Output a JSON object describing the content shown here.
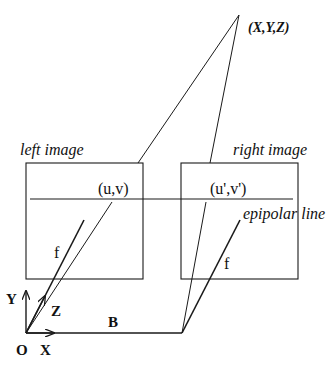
{
  "diagram": {
    "type": "stereo-camera-epipolar-geometry",
    "stroke_color": "#1a1a1a",
    "background": "#ffffff",
    "labels": {
      "world_point": "(X,Y,Z)",
      "left_image": "left image",
      "right_image": "right image",
      "left_projection": "(u,v)",
      "right_projection": "(u',v')",
      "epipolar_line": "epipolar line",
      "focal_left": "f",
      "focal_right": "f",
      "axis_y": "Y",
      "axis_z": "Z",
      "axis_x": "X",
      "origin": "O",
      "baseline": "B"
    },
    "points": {
      "world_point": [
        239,
        15
      ],
      "left_projection": [
        112,
        200
      ],
      "right_projection": [
        206,
        200
      ],
      "left_camera_origin": [
        26,
        333
      ],
      "right_camera_origin": [
        182,
        333
      ]
    },
    "boxes": {
      "left_image": {
        "x": 26,
        "y": 163,
        "w": 117,
        "h": 116
      },
      "right_image": {
        "x": 181,
        "y": 163,
        "w": 117,
        "h": 116
      }
    },
    "epipolar_line_y": 199
  }
}
